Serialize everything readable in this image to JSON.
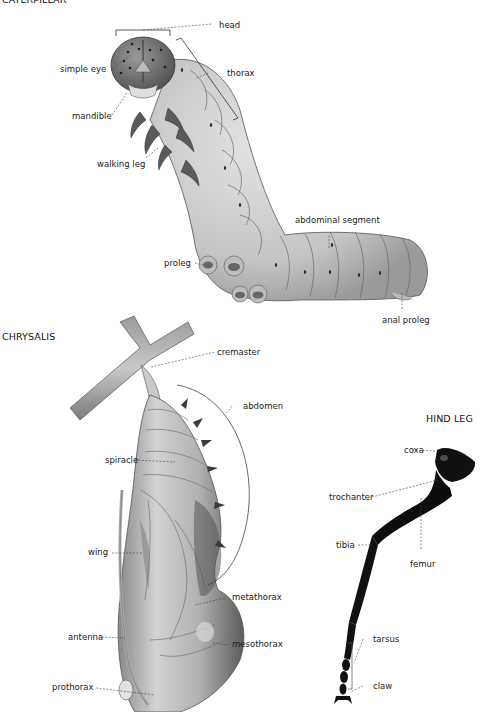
{
  "sections": {
    "caterpillar": {
      "title": "CATERPILLAR",
      "labels": {
        "head": "head",
        "simple_eye": "simple eye",
        "thorax": "thorax",
        "mandible": "mandible",
        "walking_leg": "walking leg",
        "abdominal_segment": "abdominal segment",
        "proleg": "proleg",
        "anal_proleg": "anal proleg"
      }
    },
    "chrysalis": {
      "title": "CHRYSALIS",
      "labels": {
        "cremaster": "cremaster",
        "abdomen": "abdomen",
        "spiracle": "spiracle",
        "wing": "wing",
        "metathorax": "metathorax",
        "antenna": "antenna",
        "mesothorax": "mesothorax",
        "prothorax": "prothorax"
      }
    },
    "hind_leg": {
      "title": "HIND LEG",
      "labels": {
        "coxa": "coxa",
        "trochanter": "trochanter",
        "tibia": "tibia",
        "femur": "femur",
        "tarsus": "tarsus",
        "claw": "claw"
      }
    }
  },
  "colors": {
    "body_light": "#cfcfcf",
    "body_mid": "#a8a8a8",
    "body_dark": "#6e6e6e",
    "leg_black": "#111111",
    "leader": "#444444"
  }
}
